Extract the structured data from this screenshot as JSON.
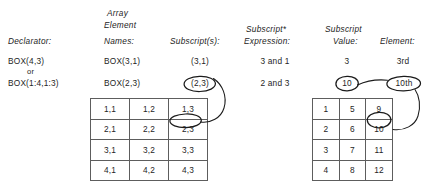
{
  "figure": {
    "columns": {
      "declarator": "Declarator:",
      "array_element_names_l1": "Array",
      "array_element_names_l2": "Element",
      "array_element_names_l3": "Names:",
      "subscripts": "Subscript(s):",
      "subscript_expression_l1": "Subscript*",
      "subscript_expression_l2": "Expression:",
      "subscript_value_l1": "Subscript",
      "subscript_value_l2": "Value:",
      "element": "Element:"
    },
    "rows": [
      {
        "declarator": "BOX(4,3)",
        "array_element_name": "BOX(3,1)",
        "subscripts": "(3,1)",
        "subscript_expression": "3 and 1",
        "subscript_value": "3",
        "element": "3rd"
      },
      {
        "declarator": "BOX(1:4,1:3)",
        "declarator_connector": "or",
        "array_element_name": "BOX(2,3)",
        "subscripts": "(2,3)",
        "subscript_expression": "2 and 3",
        "subscript_value": "10",
        "element": "10th"
      }
    ],
    "left_grid": {
      "caption": "array element name grid",
      "cells": [
        [
          "1,1",
          "1,2",
          "1,3"
        ],
        [
          "2,1",
          "2,2",
          "2,3"
        ],
        [
          "3,1",
          "3,2",
          "3,3"
        ],
        [
          "4,1",
          "4,2",
          "4,3"
        ]
      ],
      "highlighted_cell": "2,3"
    },
    "right_grid": {
      "caption": "element position grid",
      "cells": [
        [
          "1",
          "5",
          "9"
        ],
        [
          "2",
          "6",
          "10"
        ],
        [
          "3",
          "7",
          "11"
        ],
        [
          "4",
          "8",
          "12"
        ]
      ],
      "highlighted_cell": "10"
    },
    "annotations": {
      "circled_subscript": "(2,3)",
      "circled_subscript_value": "10",
      "circled_element": "10th",
      "circled_left_cell": "2,3",
      "circled_right_cell": "10"
    }
  }
}
